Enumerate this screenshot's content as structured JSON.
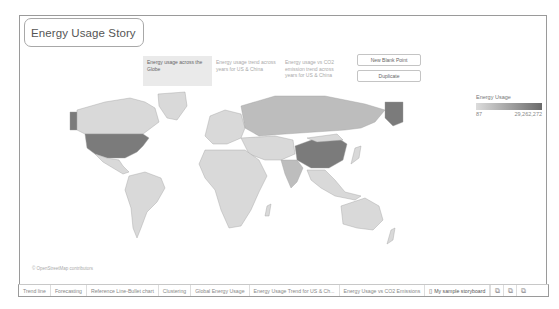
{
  "story": {
    "title": "Energy Usage Story"
  },
  "story_points": [
    {
      "label": "Energy usage across the Globe",
      "active": true
    },
    {
      "label": "Energy usage trend across years for US & China",
      "active": false
    },
    {
      "label": "Energy usage vs CO2 emission trend across years for US & China",
      "active": false
    }
  ],
  "buttons": {
    "new_blank_point": "New Blank Point",
    "duplicate": "Duplicate"
  },
  "legend": {
    "title": "Energy Usage",
    "min": "87",
    "max": "29,262,272",
    "color_low": "#dcdcdc",
    "color_high": "#6a6a6a"
  },
  "map": {
    "attribution": "© OpenStreetMap contributors",
    "highlighted_dark": [
      "United States",
      "China",
      "Alaska"
    ],
    "highlighted_mid": [
      "Russia",
      "India",
      "Canada"
    ]
  },
  "tabs": [
    {
      "label": "Trend line"
    },
    {
      "label": "Forecasting"
    },
    {
      "label": "Reference Line-Bullet chart"
    },
    {
      "label": "Clustering"
    },
    {
      "label": "Global Energy Usage"
    },
    {
      "label": "Energy Usage Trend for US & Ch..."
    },
    {
      "label": "Energy Usage vs CO2 Emissions"
    },
    {
      "label": "My sample storyboard",
      "current": true
    }
  ],
  "tab_icons": [
    "new-worksheet-icon",
    "new-dashboard-icon",
    "new-story-icon"
  ]
}
